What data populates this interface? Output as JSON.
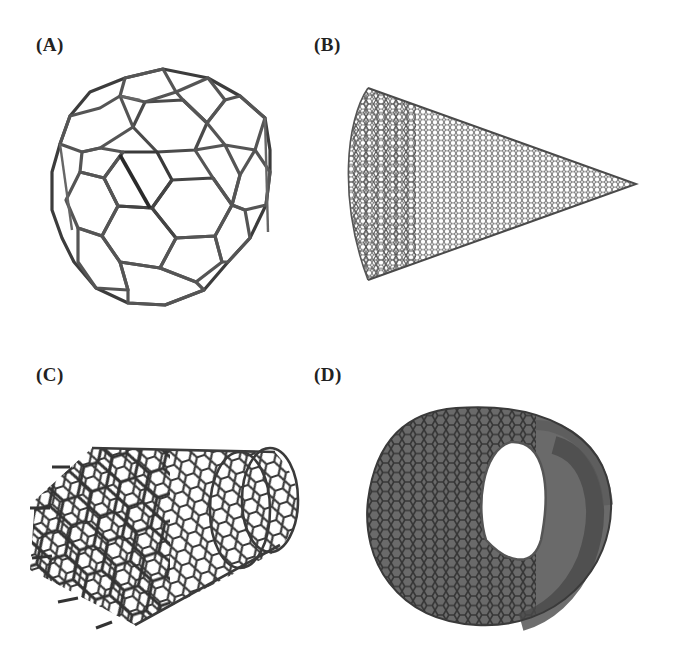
{
  "figure": {
    "panels": [
      {
        "id": "A",
        "label": "(A)",
        "structure": "fullerene-sphere"
      },
      {
        "id": "B",
        "label": "(B)",
        "structure": "nanocone"
      },
      {
        "id": "C",
        "label": "(C)",
        "structure": "single-walled-nanotube"
      },
      {
        "id": "D",
        "label": "(D)",
        "structure": "nanotube-end-view"
      }
    ]
  },
  "colors": {
    "background": "#ffffff",
    "label": "#222222",
    "bond": "#4a4a4a",
    "bond_dark": "#2e2e2e",
    "bond_light": "#7a7a7a"
  }
}
